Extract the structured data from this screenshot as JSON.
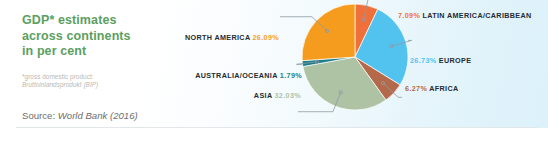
{
  "headline": {
    "line1": "GDP* estimates",
    "line2": "across continents",
    "line3": "in per cent"
  },
  "footnote": {
    "line1": "*gross domestic product:",
    "line2": "Bruttoinlandsprodukt (BIP)"
  },
  "source": {
    "prefix": "Source:",
    "reference": "World Bank (2016)"
  },
  "colors": {
    "headline_green": "#5ba05f",
    "label_dark": "#232c33",
    "footnote_gray": "#b9b9b2",
    "source_gray": "#6d6d6d",
    "leader_line": "#8d9aa3"
  },
  "chart_data": {
    "type": "pie",
    "title": "GDP* estimates across continents in per cent",
    "unit": "percent",
    "start_angle_deg": 0,
    "direction": "clockwise",
    "legend": "callout-labels",
    "categories": [
      "LATIN AMERICA/CARIBBEAN",
      "EUROPE",
      "AFRICA",
      "ASIA",
      "AUSTRALIA/OCEANIA",
      "NORTH AMERICA"
    ],
    "values": [
      7.09,
      26.73,
      6.27,
      32.03,
      1.79,
      26.09
    ],
    "labels": [
      "7.09%",
      "26.73%",
      "6.27%",
      "32.03%",
      "1.79%",
      "26.09%"
    ],
    "slice_colors": [
      "#f0703c",
      "#52c3ef",
      "#b4694a",
      "#aec2a4",
      "#1c7f8c",
      "#f59c1f"
    ],
    "slices": [
      {
        "name": "LATIN AMERICA/CARIBBEAN",
        "value": 7.09,
        "label": "7.09%",
        "color": "#f0703c"
      },
      {
        "name": "EUROPE",
        "value": 26.73,
        "label": "26.73%",
        "color": "#52c3ef"
      },
      {
        "name": "AFRICA",
        "value": 6.27,
        "label": "6.27%",
        "color": "#b4694a"
      },
      {
        "name": "ASIA",
        "value": 32.03,
        "label": "32.03%",
        "color": "#aec2a4"
      },
      {
        "name": "AUSTRALIA/OCEANIA",
        "value": 1.79,
        "label": "1.79%",
        "color": "#1c7f8c"
      },
      {
        "name": "NORTH AMERICA",
        "value": 26.09,
        "label": "26.09%",
        "color": "#f59c1f"
      }
    ]
  }
}
